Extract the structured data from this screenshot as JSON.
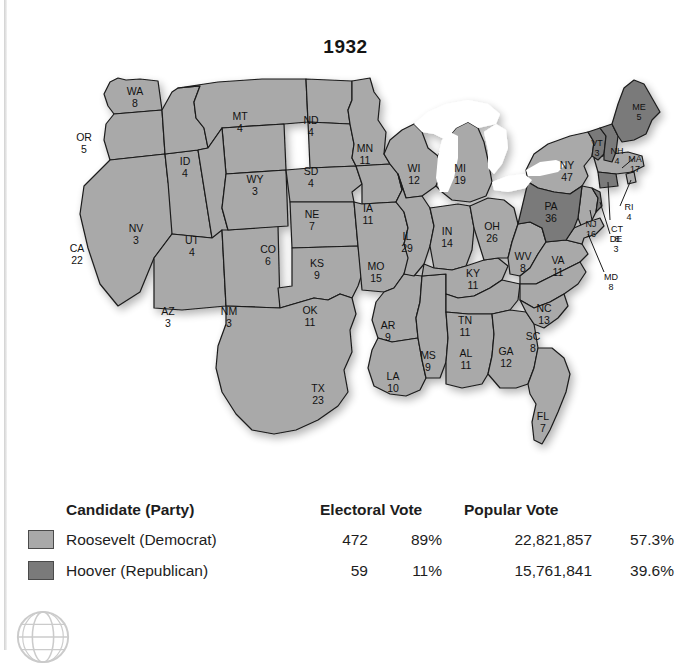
{
  "title": "1932",
  "colors": {
    "democrat_fill": "#a9a9a9",
    "republican_fill": "#7a7a7a",
    "water": "#ffffff",
    "border": "#1a1a1a",
    "page_background": "#ffffff"
  },
  "map": {
    "name": "united-states-electoral-map-1932",
    "water_features": [
      "Great Lakes"
    ],
    "states": [
      {
        "code": "WA",
        "votes": "8",
        "winner": "democrat",
        "x": 113,
        "y": 33
      },
      {
        "code": "OR",
        "votes": "5",
        "winner": "democrat",
        "x": 62,
        "y": 79
      },
      {
        "code": "CA",
        "votes": "22",
        "winner": "democrat",
        "x": 55,
        "y": 190
      },
      {
        "code": "NV",
        "votes": "3",
        "winner": "democrat",
        "x": 114,
        "y": 170
      },
      {
        "code": "ID",
        "votes": "4",
        "winner": "democrat",
        "x": 163,
        "y": 103
      },
      {
        "code": "MT",
        "votes": "4",
        "winner": "democrat",
        "x": 218,
        "y": 58
      },
      {
        "code": "WY",
        "votes": "3",
        "winner": "democrat",
        "x": 233,
        "y": 121
      },
      {
        "code": "UT",
        "votes": "4",
        "winner": "democrat",
        "x": 170,
        "y": 182
      },
      {
        "code": "AZ",
        "votes": "3",
        "winner": "democrat",
        "x": 146,
        "y": 253
      },
      {
        "code": "NM",
        "votes": "3",
        "winner": "democrat",
        "x": 207,
        "y": 253
      },
      {
        "code": "CO",
        "votes": "6",
        "winner": "democrat",
        "x": 246,
        "y": 191
      },
      {
        "code": "ND",
        "votes": "4",
        "winner": "democrat",
        "x": 289,
        "y": 62
      },
      {
        "code": "SD",
        "votes": "4",
        "winner": "democrat",
        "x": 289,
        "y": 113
      },
      {
        "code": "NE",
        "votes": "7",
        "winner": "democrat",
        "x": 290,
        "y": 156
      },
      {
        "code": "KS",
        "votes": "9",
        "winner": "democrat",
        "x": 295,
        "y": 205
      },
      {
        "code": "OK",
        "votes": "11",
        "winner": "democrat",
        "x": 288,
        "y": 252
      },
      {
        "code": "TX",
        "votes": "23",
        "winner": "democrat",
        "x": 296,
        "y": 330
      },
      {
        "code": "MN",
        "votes": "11",
        "winner": "democrat",
        "x": 343,
        "y": 90
      },
      {
        "code": "IA",
        "votes": "11",
        "winner": "democrat",
        "x": 346,
        "y": 150
      },
      {
        "code": "MO",
        "votes": "15",
        "winner": "democrat",
        "x": 354,
        "y": 208
      },
      {
        "code": "AR",
        "votes": "9",
        "winner": "democrat",
        "x": 366,
        "y": 267
      },
      {
        "code": "LA",
        "votes": "10",
        "winner": "democrat",
        "x": 371,
        "y": 318
      },
      {
        "code": "WI",
        "votes": "12",
        "winner": "democrat",
        "x": 392,
        "y": 110
      },
      {
        "code": "IL",
        "votes": "29",
        "winner": "democrat",
        "x": 385,
        "y": 178
      },
      {
        "code": "MS",
        "votes": "9",
        "winner": "democrat",
        "x": 406,
        "y": 297
      },
      {
        "code": "MI",
        "votes": "19",
        "winner": "democrat",
        "x": 438,
        "y": 110
      },
      {
        "code": "IN",
        "votes": "14",
        "winner": "democrat",
        "x": 425,
        "y": 173
      },
      {
        "code": "KY",
        "votes": "11",
        "winner": "democrat",
        "x": 451,
        "y": 215
      },
      {
        "code": "TN",
        "votes": "11",
        "winner": "democrat",
        "x": 443,
        "y": 262
      },
      {
        "code": "AL",
        "votes": "11",
        "winner": "democrat",
        "x": 444,
        "y": 295
      },
      {
        "code": "OH",
        "votes": "26",
        "winner": "democrat",
        "x": 470,
        "y": 168
      },
      {
        "code": "GA",
        "votes": "12",
        "winner": "democrat",
        "x": 484,
        "y": 293
      },
      {
        "code": "WV",
        "votes": "8",
        "winner": "democrat",
        "x": 501,
        "y": 198
      },
      {
        "code": "VA",
        "votes": "11",
        "winner": "democrat",
        "x": 536,
        "y": 202
      },
      {
        "code": "NC",
        "votes": "13",
        "winner": "democrat",
        "x": 522,
        "y": 250
      },
      {
        "code": "SC",
        "votes": "8",
        "winner": "democrat",
        "x": 511,
        "y": 278
      },
      {
        "code": "FL",
        "votes": "7",
        "winner": "democrat",
        "x": 521,
        "y": 358
      },
      {
        "code": "NY",
        "votes": "47",
        "winner": "democrat",
        "x": 545,
        "y": 107
      },
      {
        "code": "NJ",
        "votes": "16",
        "winner": "democrat",
        "x": 569,
        "y": 165
      },
      {
        "code": "MD",
        "votes": "8",
        "winner": "democrat",
        "x": 589,
        "y": 218
      },
      {
        "code": "MA",
        "votes": "17",
        "winner": "democrat",
        "x": 613,
        "y": 100
      },
      {
        "code": "RI",
        "votes": "4",
        "winner": "democrat",
        "x": 607,
        "y": 148
      },
      {
        "code": "PA",
        "votes": "36",
        "winner": "republican",
        "x": 529,
        "y": 148
      },
      {
        "code": "VT",
        "votes": "3",
        "winner": "republican",
        "x": 575,
        "y": 84
      },
      {
        "code": "NH",
        "votes": "4",
        "winner": "republican",
        "x": 595,
        "y": 92
      },
      {
        "code": "ME",
        "votes": "5",
        "winner": "republican",
        "x": 617,
        "y": 48
      },
      {
        "code": "CT",
        "votes": "8",
        "winner": "republican",
        "x": 595,
        "y": 170
      },
      {
        "code": "DE",
        "votes": "3",
        "winner": "republican",
        "x": 594,
        "y": 180
      }
    ]
  },
  "legend": {
    "headers": {
      "candidate": "Candidate (Party)",
      "electoral_vote": "Electoral Vote",
      "popular_vote": "Popular Vote"
    },
    "rows": [
      {
        "candidate": "Roosevelt (Democrat)",
        "electoral_vote": "472",
        "electoral_pct": "89%",
        "popular_vote": "22,821,857",
        "popular_pct": "57.3%",
        "swatch": "democrat"
      },
      {
        "candidate": "Hoover (Republican)",
        "electoral_vote": "59",
        "electoral_pct": "11%",
        "popular_vote": "15,761,841",
        "popular_pct": "39.6%",
        "swatch": "republican"
      }
    ]
  },
  "watermark": {
    "icon": "globe-icon"
  }
}
